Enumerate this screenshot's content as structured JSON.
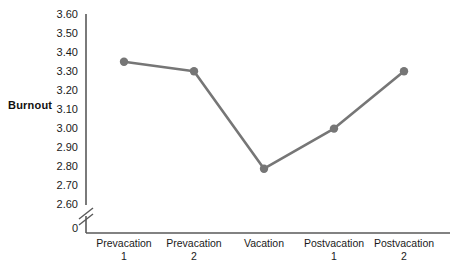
{
  "chart_data": {
    "type": "line",
    "title": "",
    "xlabel": "",
    "ylabel": "Burnout",
    "categories": [
      "Prevacation 1",
      "Prevacation 2",
      "Vacation",
      "Postvacation 1",
      "Postvacation 2"
    ],
    "category_lines": [
      [
        "Prevacation",
        "1"
      ],
      [
        "Prevacation",
        "2"
      ],
      [
        "Vacation",
        ""
      ],
      [
        "Postvacation",
        "1"
      ],
      [
        "Postvacation",
        "2"
      ]
    ],
    "series": [
      {
        "name": "Burnout",
        "values": [
          3.35,
          3.3,
          2.79,
          3.0,
          3.3
        ],
        "color": "#767676",
        "marker": "circle"
      }
    ],
    "ylim": [
      2.6,
      3.6
    ],
    "ytick_labels": [
      "3.60",
      "3.50",
      "3.40",
      "3.30",
      "3.20",
      "3.10",
      "3.00",
      "2.90",
      "2.80",
      "2.70",
      "2.60",
      "0"
    ],
    "ytick_values": [
      3.6,
      3.5,
      3.4,
      3.3,
      3.2,
      3.1,
      3.0,
      2.9,
      2.8,
      2.7,
      2.6
    ],
    "axis_break": true,
    "axis_break_label": "0",
    "grid": false,
    "legend": "none",
    "axis_color": "#595959"
  },
  "ylabels": {
    "t0": "3.60",
    "t1": "3.50",
    "t2": "3.40",
    "t3": "3.30",
    "t4": "3.20",
    "t5": "3.10",
    "t6": "3.00",
    "t7": "2.90",
    "t8": "2.80",
    "t9": "2.70",
    "t10": "2.60",
    "zero": "0"
  },
  "xlabels": {
    "c0_l1": "Prevacation",
    "c0_l2": "1",
    "c1_l1": "Prevacation",
    "c1_l2": "2",
    "c2_l1": "Vacation",
    "c2_l2": "",
    "c3_l1": "Postvacation",
    "c3_l2": "1",
    "c4_l1": "Postvacation",
    "c4_l2": "2"
  },
  "axis_title": {
    "y": "Burnout"
  }
}
